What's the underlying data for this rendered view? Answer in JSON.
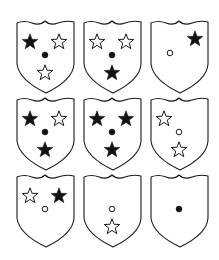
{
  "diagram": {
    "title": "",
    "layout": {
      "rows": 3,
      "cols": 3
    },
    "colors": {
      "stroke": "#1a1a1a",
      "fill": "#111111",
      "background": "#ffffff"
    },
    "symbol_positions": {
      "top_left": [
        14,
        22
      ],
      "top_right": [
        43,
        22
      ],
      "center": [
        29,
        35
      ],
      "bottom": [
        29,
        53
      ],
      "corner_top_right": [
        45,
        19
      ],
      "left_center": [
        20,
        33
      ]
    },
    "shields": [
      {
        "id": "r1c1",
        "x": 16,
        "y": 20,
        "symbols": [
          {
            "type": "star",
            "filled": true,
            "pos": "top_left"
          },
          {
            "type": "star",
            "filled": false,
            "pos": "top_right"
          },
          {
            "type": "dot",
            "filled": true,
            "pos": "center"
          },
          {
            "type": "star",
            "filled": false,
            "pos": "bottom"
          }
        ]
      },
      {
        "id": "r1c2",
        "x": 83,
        "y": 20,
        "symbols": [
          {
            "type": "star",
            "filled": false,
            "pos": "top_left"
          },
          {
            "type": "star",
            "filled": false,
            "pos": "top_right"
          },
          {
            "type": "dot",
            "filled": true,
            "pos": "center"
          },
          {
            "type": "star",
            "filled": true,
            "pos": "bottom"
          }
        ]
      },
      {
        "id": "r1c3",
        "x": 150,
        "y": 20,
        "symbols": [
          {
            "type": "star",
            "filled": true,
            "pos": "corner_top_right"
          },
          {
            "type": "dot",
            "filled": false,
            "pos": "left_center"
          }
        ]
      },
      {
        "id": "r2c1",
        "x": 16,
        "y": 97,
        "symbols": [
          {
            "type": "star",
            "filled": true,
            "pos": "top_left"
          },
          {
            "type": "star",
            "filled": false,
            "pos": "top_right"
          },
          {
            "type": "dot",
            "filled": true,
            "pos": "center"
          },
          {
            "type": "star",
            "filled": true,
            "pos": "bottom"
          }
        ]
      },
      {
        "id": "r2c2",
        "x": 83,
        "y": 97,
        "symbols": [
          {
            "type": "star",
            "filled": true,
            "pos": "top_left"
          },
          {
            "type": "star",
            "filled": true,
            "pos": "top_right"
          },
          {
            "type": "dot",
            "filled": true,
            "pos": "center"
          },
          {
            "type": "star",
            "filled": true,
            "pos": "bottom"
          }
        ]
      },
      {
        "id": "r2c3",
        "x": 150,
        "y": 97,
        "symbols": [
          {
            "type": "star",
            "filled": false,
            "pos": "top_left"
          },
          {
            "type": "dot",
            "filled": false,
            "pos": "center"
          },
          {
            "type": "star",
            "filled": false,
            "pos": "bottom"
          }
        ]
      },
      {
        "id": "r3c1",
        "x": 16,
        "y": 174,
        "symbols": [
          {
            "type": "star",
            "filled": false,
            "pos": "top_left"
          },
          {
            "type": "star",
            "filled": true,
            "pos": "top_right"
          },
          {
            "type": "dot",
            "filled": false,
            "pos": "center"
          }
        ]
      },
      {
        "id": "r3c2",
        "x": 83,
        "y": 174,
        "symbols": [
          {
            "type": "dot",
            "filled": false,
            "pos": "center"
          },
          {
            "type": "star",
            "filled": false,
            "pos": "bottom"
          }
        ]
      },
      {
        "id": "r3c3",
        "x": 150,
        "y": 174,
        "symbols": [
          {
            "type": "dot",
            "filled": true,
            "pos": "center"
          }
        ]
      }
    ]
  }
}
